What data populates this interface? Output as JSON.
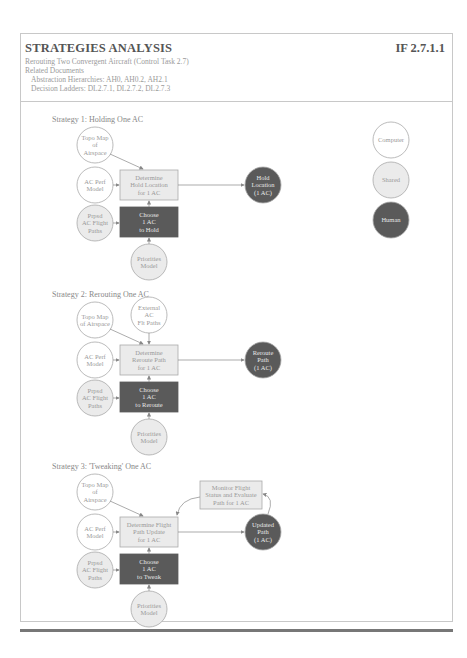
{
  "header": {
    "title": "STRATEGIES ANALYSIS",
    "code": "IF 2.7.1.1",
    "subtitle": "Rerouting Two Convergent Aircraft (Control Task 2.7)",
    "related_label": "Related Documents",
    "abstraction": "Abstraction Hierarchies: AH0, AH0.2, AH2.1",
    "ladders": "Decision Ladders: DL2.7.1, DL2.7.2, DL2.7.3"
  },
  "legend": {
    "computer": "Computer",
    "shared": "Shared",
    "human": "Human"
  },
  "strategies": [
    {
      "title": "Strategy 1: Holding One AC",
      "inputs": [
        [
          "Topo Map",
          "of",
          "Airspace"
        ],
        [
          "AC Perf",
          "Model"
        ],
        [
          "Prpsd",
          "AC Flight",
          "Paths"
        ]
      ],
      "process": [
        "Determine",
        "Hold Location",
        "for 1 AC"
      ],
      "choose": [
        "Choose",
        "1 AC",
        "to Hold"
      ],
      "priorities": [
        "Priorities",
        "Model"
      ],
      "output": [
        "Hold",
        "Location",
        "(1 AC)"
      ]
    },
    {
      "title": "Strategy 2: Rerouting One AC",
      "inputs": [
        [
          "Topo Map",
          "of Airspace"
        ],
        [
          "AC Perf",
          "Model"
        ],
        [
          "Prpsd",
          "AC Flight",
          "Paths"
        ]
      ],
      "external": [
        "External",
        "AC",
        "Flt Paths"
      ],
      "process": [
        "Determine",
        "Reroute Path",
        "for 1 AC"
      ],
      "choose": [
        "Choose",
        "1 AC",
        "to Reroute"
      ],
      "priorities": [
        "Priorities",
        "Model"
      ],
      "output": [
        "Reroute",
        "Path",
        "(1 AC)"
      ]
    },
    {
      "title": "Strategy 3: 'Tweaking' One AC",
      "inputs": [
        [
          "Topo Map",
          "of",
          "Airspace"
        ],
        [
          "AC Perf",
          "Model"
        ],
        [
          "Prpsd",
          "AC Flight",
          "Paths"
        ]
      ],
      "monitor": [
        "Monitor Flight",
        "Status and Evaluate",
        "Path for 1 AC"
      ],
      "process": [
        "Determine Flight",
        "Path Update",
        "for 1 AC"
      ],
      "choose": [
        "Choose",
        "1 AC",
        "to Tweak"
      ],
      "priorities": [
        "Priorities",
        "Model"
      ],
      "output": [
        "Updated",
        "Path",
        "(1 AC)"
      ]
    }
  ],
  "colors": {
    "computer": "#ffffff",
    "shared": "#ebebeb",
    "human": "#5a5a5a",
    "stroke": "#aaaaaa"
  }
}
